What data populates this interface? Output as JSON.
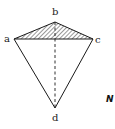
{
  "diagram": {
    "type": "geometric-figure",
    "vertices": [
      {
        "id": "a",
        "label": "a",
        "x": 14,
        "y": 39
      },
      {
        "id": "b",
        "label": "b",
        "x": 55,
        "y": 22
      },
      {
        "id": "c",
        "label": "c",
        "x": 93,
        "y": 39
      },
      {
        "id": "d",
        "label": "d",
        "x": 55,
        "y": 108
      }
    ],
    "edges": [
      {
        "from": "a",
        "to": "b",
        "style": "solid"
      },
      {
        "from": "b",
        "to": "c",
        "style": "solid"
      },
      {
        "from": "a",
        "to": "c",
        "style": "solid"
      },
      {
        "from": "a",
        "to": "d",
        "style": "solid"
      },
      {
        "from": "c",
        "to": "d",
        "style": "solid"
      },
      {
        "from": "b",
        "to": "d",
        "style": "dashed"
      }
    ],
    "hatched_region": [
      "a",
      "b",
      "c"
    ],
    "edge_fragment_text": "N",
    "colors": {
      "stroke": "#1a1a1a",
      "background": "#ffffff"
    }
  }
}
